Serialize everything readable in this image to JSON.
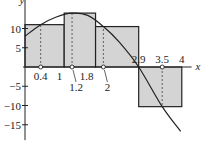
{
  "chart_data": {
    "type": "bar",
    "title": "",
    "xlabel": "x",
    "ylabel": "y",
    "xlim": [
      0,
      4.25
    ],
    "ylim": [
      -19,
      17
    ],
    "grid": false,
    "yticks": [
      10,
      5,
      -5,
      -10,
      -15
    ],
    "ytick_labels": [
      "10",
      "5",
      "−5",
      "−10",
      "−15"
    ],
    "xtick_labels_above": [
      {
        "x": 2.9,
        "label": "2.9"
      },
      {
        "x": 3.5,
        "label": "3.5"
      },
      {
        "x": 4,
        "label": "4"
      }
    ],
    "xtick_labels_below": [
      {
        "x": 0.4,
        "label": "0.4"
      },
      {
        "x": 1,
        "label": "1"
      },
      {
        "x": 1.2,
        "label": "1.2"
      },
      {
        "x": 1.8,
        "label": "1.8"
      },
      {
        "x": 2,
        "label": "2"
      }
    ],
    "rectangles": [
      {
        "x0": 0,
        "x1": 1,
        "sample_x": 0.4,
        "height": 11
      },
      {
        "x0": 1,
        "x1": 1.8,
        "sample_x": 1.2,
        "height": 14
      },
      {
        "x0": 1.8,
        "x1": 2.9,
        "sample_x": 2,
        "height": 10.5
      },
      {
        "x0": 2.9,
        "x1": 4,
        "sample_x": 3.5,
        "height": -10.3
      }
    ],
    "curve": {
      "x": [
        0,
        0.4,
        0.8,
        1.2,
        1.6,
        2,
        2.4,
        2.9,
        3.5,
        3.97
      ],
      "y": [
        8,
        11,
        13,
        14,
        13.4,
        10.5,
        6.5,
        0,
        -10.3,
        -16.7
      ]
    },
    "colors": {
      "fill": "#d4d4d4",
      "stroke": "#222222",
      "dash": "#444444"
    }
  }
}
